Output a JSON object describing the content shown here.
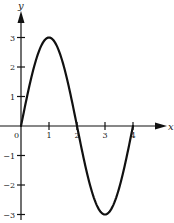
{
  "chart_data": {
    "type": "line",
    "title": "",
    "xlabel": "x",
    "ylabel": "y",
    "function": "y = 3 sin(pi x / 2)",
    "x_ticks": [
      "0",
      "1",
      "2",
      "3",
      "4"
    ],
    "y_ticks": [
      "3",
      "2",
      "1",
      "−1",
      "−2",
      "−3"
    ],
    "xlim": [
      0,
      4.5
    ],
    "ylim": [
      -3,
      3.5
    ],
    "grid": false,
    "legend": null,
    "series": [
      {
        "name": "y",
        "x": [
          0,
          0.5,
          1,
          1.5,
          2,
          2.5,
          3,
          3.5,
          4
        ],
        "values": [
          0,
          2.12,
          3,
          2.12,
          0,
          -2.12,
          -3,
          -2.12,
          0
        ]
      }
    ],
    "colors": {
      "line": "#111111",
      "axis": "#111111",
      "background": "#ffffff"
    }
  }
}
